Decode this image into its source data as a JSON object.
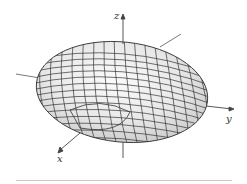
{
  "figure": {
    "type": "ellipsoid-wireframe",
    "axes": {
      "x_label": "x",
      "y_label": "y",
      "z_label": "z"
    },
    "colors": {
      "surface_fill": "#e6e6e6",
      "surface_highlight": "#f7f7f7",
      "mesh_line": "#333333",
      "axis_line": "#444444",
      "rule_line": "#c8c8c8"
    }
  }
}
